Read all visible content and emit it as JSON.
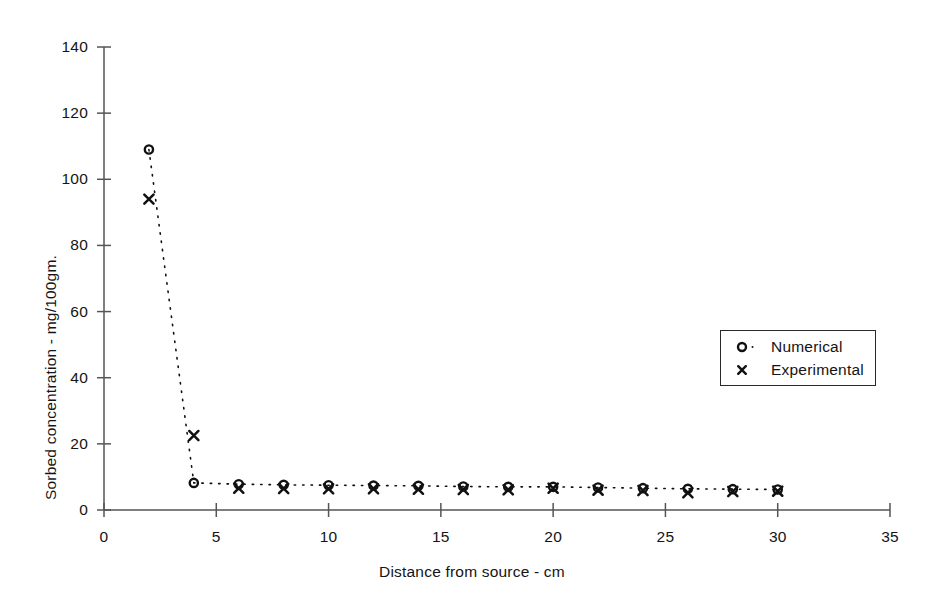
{
  "chart_data": {
    "type": "scatter",
    "title": "",
    "xlabel": "Distance from source  -  cm",
    "ylabel": "Sorbed concentration  -  mg/100gm.",
    "xlim": [
      0,
      35
    ],
    "ylim": [
      0,
      140
    ],
    "xticks": [
      0,
      5,
      10,
      15,
      20,
      25,
      30,
      35
    ],
    "yticks": [
      0,
      20,
      40,
      60,
      80,
      100,
      120,
      140
    ],
    "grid": false,
    "legend_position": "right-middle",
    "x": [
      2,
      4,
      6,
      8,
      10,
      12,
      14,
      16,
      18,
      20,
      22,
      24,
      26,
      28,
      30
    ],
    "series": [
      {
        "name": "Numerical",
        "marker": "circle-open",
        "line": "dotted",
        "values": [
          109,
          8.2,
          7.8,
          7.6,
          7.5,
          7.4,
          7.3,
          7.1,
          7.0,
          7.0,
          6.8,
          6.6,
          6.4,
          6.3,
          6.2
        ]
      },
      {
        "name": "Experimental",
        "marker": "cross",
        "line": "none",
        "values": [
          94,
          22.5,
          6.6,
          6.5,
          6.4,
          6.4,
          6.3,
          6.2,
          6.1,
          6.6,
          6.0,
          5.9,
          5.2,
          5.6,
          5.7
        ]
      }
    ]
  },
  "axes": {
    "x_tick_labels": [
      "0",
      "5",
      "10",
      "15",
      "20",
      "25",
      "30",
      "35"
    ],
    "y_tick_labels": [
      "0",
      "20",
      "40",
      "60",
      "80",
      "100",
      "120",
      "140"
    ],
    "x_title": "Distance from source  -  cm",
    "y_title": "Sorbed concentration  -  mg/100gm."
  },
  "legend": {
    "items": [
      {
        "label": "Numerical",
        "marker": "circle-open"
      },
      {
        "label": "Experimental",
        "marker": "cross"
      }
    ]
  },
  "colors": {
    "axis": "#555555",
    "marker": "#111111",
    "text": "#141414",
    "background": "#ffffff"
  }
}
